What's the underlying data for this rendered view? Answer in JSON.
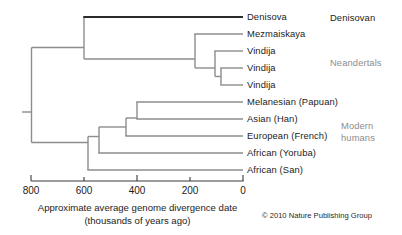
{
  "figure": {
    "copyright": "© 2010 Nature Publishing Group"
  },
  "axis": {
    "label_line1": "Approximate average genome divergence date",
    "label_line2": "(thousands of years ago)",
    "ticks": [
      "800",
      "600",
      "400",
      "200",
      "0"
    ],
    "tick_values": [
      800,
      600,
      400,
      200,
      0
    ],
    "minor_tick_values": [
      700,
      500,
      300,
      100
    ],
    "range_left": 800,
    "range_right": 0,
    "direction": "reversed"
  },
  "groups": [
    {
      "id": "denisovan",
      "label": "Denisovan",
      "color": "#1c1c1c"
    },
    {
      "id": "neandertals",
      "label": "Neandertals",
      "color": "#8d8d8d"
    },
    {
      "id": "modern",
      "label_line1": "Modern",
      "label_line2": "humans",
      "color": "#8d8d8d"
    }
  ],
  "tips": [
    {
      "id": "denisova",
      "label": "Denisova",
      "group": "denisovan"
    },
    {
      "id": "mezmaiskaya",
      "label": "Mezmaiskaya",
      "group": "neandertals"
    },
    {
      "id": "vindija1",
      "label": "Vindija",
      "group": "neandertals"
    },
    {
      "id": "vindija2",
      "label": "Vindija",
      "group": "neandertals"
    },
    {
      "id": "vindija3",
      "label": "Vindija",
      "group": "neandertals"
    },
    {
      "id": "melanesian",
      "label": "Melanesian (Papuan)",
      "group": "modern"
    },
    {
      "id": "asian",
      "label": "Asian (Han)",
      "group": "modern"
    },
    {
      "id": "european",
      "label": "European (French)",
      "group": "modern"
    },
    {
      "id": "yoruba",
      "label": "African (Yoruba)",
      "group": "modern"
    },
    {
      "id": "san",
      "label": "African (San)",
      "group": "modern"
    }
  ],
  "chart_data": {
    "type": "tree",
    "title": "Approximate average genome divergence date",
    "xlabel": "Approximate average genome divergence date (thousands of years ago)",
    "ylabel": "",
    "xlim": [
      800,
      0
    ],
    "x_units": "thousands of years ago",
    "grid": false,
    "legend": "right-side group brackets",
    "leaves": [
      {
        "name": "Denisova",
        "row": 0,
        "divergence_kya": 0
      },
      {
        "name": "Mezmaiskaya",
        "row": 1,
        "divergence_kya": 0
      },
      {
        "name": "Vindija",
        "row": 2,
        "divergence_kya": 0
      },
      {
        "name": "Vindija",
        "row": 3,
        "divergence_kya": 0
      },
      {
        "name": "Vindija",
        "row": 4,
        "divergence_kya": 0
      },
      {
        "name": "Melanesian (Papuan)",
        "row": 5,
        "divergence_kya": 0
      },
      {
        "name": "Asian (Han)",
        "row": 6,
        "divergence_kya": 0
      },
      {
        "name": "European (French)",
        "row": 7,
        "divergence_kya": 0
      },
      {
        "name": "African (Yoruba)",
        "row": 8,
        "divergence_kya": 0
      },
      {
        "name": "African (San)",
        "row": 9,
        "divergence_kya": 0
      }
    ],
    "internal_nodes": [
      {
        "id": "root",
        "divergence_kya": 800,
        "children": [
          "archaic",
          "modern_crown"
        ]
      },
      {
        "id": "archaic",
        "divergence_kya": 620,
        "children": [
          "denisova_tip",
          "neandertal_crown"
        ]
      },
      {
        "id": "neandertal_crown",
        "divergence_kya": 180,
        "children": [
          "mezmaiskaya_tip",
          "vindija_crown"
        ]
      },
      {
        "id": "vindija_crown",
        "divergence_kya": 110,
        "children": [
          "vindija1_tip",
          "vindija_pair"
        ]
      },
      {
        "id": "vindija_pair",
        "divergence_kya": 80,
        "children": [
          "vindija2_tip",
          "vindija3_tip"
        ]
      },
      {
        "id": "modern_crown",
        "divergence_kya": 555,
        "children": [
          "san_tip",
          "modern_sub"
        ]
      },
      {
        "id": "modern_sub",
        "divergence_kya": 530,
        "children": [
          "yoruba_tip",
          "ooa"
        ]
      },
      {
        "id": "ooa",
        "divergence_kya": 470,
        "children": [
          "european_tip",
          "eurasia"
        ]
      },
      {
        "id": "eurasia",
        "divergence_kya": 440,
        "children": [
          "melanesian_tip",
          "asian_tip"
        ]
      }
    ],
    "branch_colors": {
      "denisova_branch": "#2b2b2b",
      "default_branch": "#8d8d8d"
    },
    "tick_labels": [
      "800",
      "600",
      "400",
      "200",
      "0"
    ],
    "annotations": [
      "Denisovan",
      "Neandertals",
      "Modern humans"
    ]
  }
}
